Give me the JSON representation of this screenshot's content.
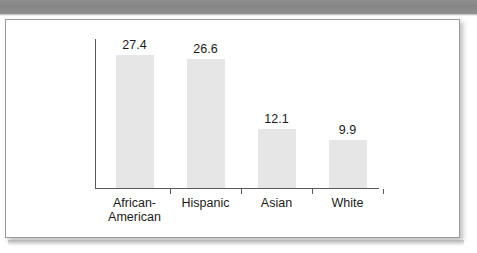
{
  "banner": {
    "color": "#8a8a8a"
  },
  "panel": {
    "background": "#ffffff",
    "border_color": "#9a9a9a"
  },
  "chart_data": {
    "type": "bar",
    "title": "",
    "xlabel": "",
    "ylabel": "",
    "categories": [
      "African-\nAmerican",
      "Hispanic",
      "Asian",
      "White"
    ],
    "values": [
      27.4,
      26.6,
      12.1,
      9.9
    ],
    "value_labels": [
      "27.4",
      "26.6",
      "12.1",
      "9.9"
    ],
    "ylim": [
      0,
      31
    ],
    "grid": false,
    "legend": false,
    "y_tick_labels": [],
    "bar_color": "#e6e6e6",
    "axis_color": "#5a5a5a"
  }
}
